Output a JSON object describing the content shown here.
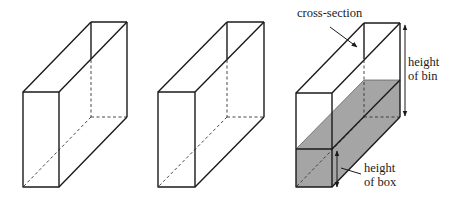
{
  "figure": {
    "width": 457,
    "height": 199,
    "colors": {
      "edge": "#1a1a1a",
      "shade": "#a5a5a5",
      "background": "#ffffff"
    },
    "boxes": [
      {
        "id": "box-1",
        "description": "empty open-top bin (isometric)"
      },
      {
        "id": "box-2",
        "description": "empty open-top bin (isometric)"
      },
      {
        "id": "box-3",
        "description": "bin partially filled with shaded box volume"
      }
    ],
    "labels": {
      "cross_section": "cross-section",
      "height_of_bin_line1": "height",
      "height_of_bin_line2": "of bin",
      "height_of_box_line1": "height",
      "height_of_box_line2": "of box"
    }
  }
}
